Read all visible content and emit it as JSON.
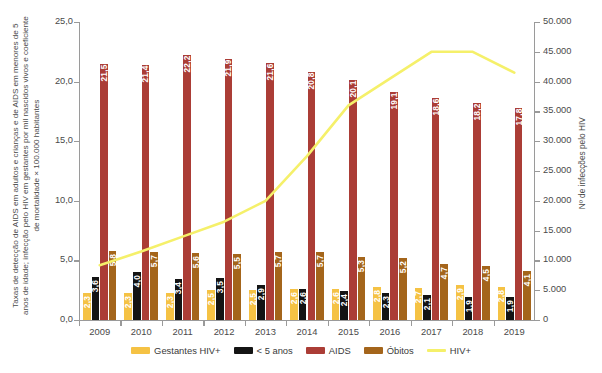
{
  "chart_data": {
    "type": "bar",
    "title": "",
    "subtitle": "",
    "xlabel": "",
    "ylabel": "Taxas de detecção de AIDS em adultos e crianças e de AIDS em menores de 5 anos de idade; infecção pelo HIV em gestantes por mil nascidos vivos e coeficiente de mortalidade × 100.000 habitantes",
    "ylabel_right": "Nº de infecções pelo HIV",
    "categories": [
      "2009",
      "2010",
      "2011",
      "2012",
      "2013",
      "2014",
      "2015",
      "2016",
      "2017",
      "2018",
      "2019"
    ],
    "ylim": [
      0,
      25
    ],
    "ylim_right": [
      0,
      50000
    ],
    "yticks": [
      "0,0",
      "5,0",
      "10,0",
      "15,0",
      "20,0",
      "25,0"
    ],
    "ytick_values": [
      0,
      5,
      10,
      15,
      20,
      25
    ],
    "yticks_right": [
      "0",
      "5.000",
      "10.000",
      "15.000",
      "20.000",
      "25.000",
      "30.000",
      "35.000",
      "40.000",
      "45.000",
      "50.000"
    ],
    "ytick_values_right": [
      0,
      5000,
      10000,
      15000,
      20000,
      25000,
      30000,
      35000,
      40000,
      45000,
      50000
    ],
    "grid": false,
    "legend_position": "bottom",
    "series": [
      {
        "name": "Gestantes HIV+",
        "kind": "bar",
        "axis": "left",
        "color": "#f5c244",
        "values": [
          2.3,
          2.3,
          2.3,
          2.5,
          2.5,
          2.6,
          2.6,
          2.8,
          2.7,
          2.9,
          2.8
        ],
        "labels": [
          "2,3",
          "2,3",
          "2,3",
          "2,5",
          "2,5",
          "2,6",
          "2,6",
          "2,8",
          "2,7",
          "2,9",
          "2,8"
        ]
      },
      {
        "name": "< 5 anos",
        "kind": "bar",
        "axis": "left",
        "color": "#141414",
        "values": [
          3.6,
          4.0,
          3.4,
          3.5,
          2.9,
          2.6,
          2.4,
          2.3,
          2.1,
          1.9,
          1.9
        ],
        "labels": [
          "3,6",
          "4,0",
          "3,4",
          "3,5",
          "2,9",
          "2,6",
          "2,4",
          "2,3",
          "2,1",
          "1,9",
          "1,9"
        ]
      },
      {
        "name": "AIDS",
        "kind": "bar",
        "axis": "left",
        "color": "#ab3d36",
        "values": [
          21.5,
          21.4,
          22.2,
          21.9,
          21.6,
          20.8,
          20.1,
          19.1,
          18.6,
          18.2,
          17.8
        ],
        "labels": [
          "21,5",
          "21,4",
          "22,2",
          "21,9",
          "21,6",
          "20,8",
          "20,1",
          "19,1",
          "18,6",
          "18,2",
          "17,8"
        ]
      },
      {
        "name": "Óbitos",
        "kind": "bar",
        "axis": "left",
        "color": "#a4651b",
        "values": [
          5.8,
          5.7,
          5.6,
          5.5,
          5.7,
          5.7,
          5.3,
          5.2,
          4.7,
          4.5,
          4.1
        ],
        "labels": [
          "5,8",
          "5,7",
          "5,6",
          "5,5",
          "5,7",
          "5,7",
          "5,3",
          "5,2",
          "4,7",
          "4,5",
          "4,1"
        ]
      },
      {
        "name": "HIV+",
        "kind": "line",
        "axis": "right",
        "color": "#f5f06a",
        "values": [
          9200,
          11500,
          14000,
          16500,
          20000,
          27500,
          36000,
          40500,
          45000,
          45000,
          41500
        ],
        "labels": []
      }
    ]
  },
  "legend": {
    "items": [
      {
        "label": "Gestantes HIV+",
        "color": "#f5c244",
        "kind": "bar"
      },
      {
        "label": "< 5 anos",
        "color": "#141414",
        "kind": "bar"
      },
      {
        "label": "AIDS",
        "color": "#ab3d36",
        "kind": "bar"
      },
      {
        "label": "Óbitos",
        "color": "#a4651b",
        "kind": "bar"
      },
      {
        "label": "HIV+",
        "color": "#f5f06a",
        "kind": "line"
      }
    ]
  }
}
